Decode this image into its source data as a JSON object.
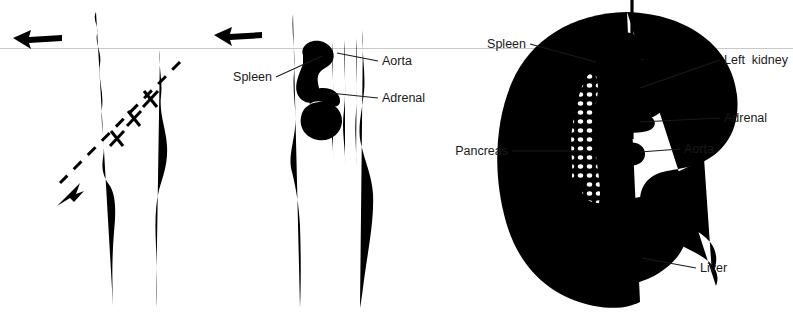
{
  "figure": {
    "panel_count": 3,
    "background_color": "#ffffff",
    "ink_color": "#000000",
    "label_color": "#1a1a1a",
    "scanline_color": "#c9c9c9"
  },
  "panels": {
    "left": {
      "name": "coronal-body-outline-with-section-plane",
      "labels": [],
      "markers": {
        "section_x_count": 3,
        "arrow_count": 2
      }
    },
    "middle": {
      "name": "coronal-organ-relations",
      "labels": [
        {
          "id": "spleen",
          "text": "Spleen",
          "x": 272,
          "y": 81,
          "anchor": "end"
        },
        {
          "id": "aorta",
          "text": "Aorta",
          "x": 382,
          "y": 65,
          "anchor": "start"
        },
        {
          "id": "adrenal",
          "text": "Adrenal",
          "x": 382,
          "y": 102,
          "anchor": "start"
        }
      ],
      "markers": {
        "arrow_count": 1
      }
    },
    "right": {
      "name": "axial-cross-section",
      "labels": [
        {
          "id": "spleen",
          "text": "Spleen",
          "x": 526,
          "y": 48,
          "anchor": "end"
        },
        {
          "id": "left-kidney",
          "text": "Left  kidney",
          "x": 724,
          "y": 64,
          "anchor": "start"
        },
        {
          "id": "adrenal",
          "text": "Adrenal",
          "x": 724,
          "y": 122,
          "anchor": "start"
        },
        {
          "id": "aorta",
          "text": "Aorta",
          "x": 684,
          "y": 153,
          "anchor": "start"
        },
        {
          "id": "pancreas",
          "text": "Pancreas",
          "x": 508,
          "y": 155,
          "anchor": "end"
        },
        {
          "id": "liver",
          "text": "Liver",
          "x": 700,
          "y": 272,
          "anchor": "start"
        }
      ],
      "markers": {
        "midline_dashed": true
      }
    }
  },
  "label_list": [
    "Spleen",
    "Aorta",
    "Adrenal",
    "Spleen",
    "Left  kidney",
    "Adrenal",
    "Aorta",
    "Pancreas",
    "Liver"
  ]
}
